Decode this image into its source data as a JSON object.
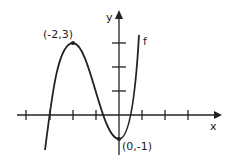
{
  "diagram": {
    "function_label": "f",
    "axis_x_label": "x",
    "axis_y_label": "y",
    "points": [
      {
        "label": "(-2,3)",
        "x": -2,
        "y": 3
      },
      {
        "label": "(0,-1)",
        "x": 0,
        "y": -1
      }
    ],
    "x_ticks": [
      -4,
      -3,
      -2,
      -1,
      1,
      2,
      3
    ],
    "y_ticks": [
      1,
      2,
      3
    ]
  }
}
